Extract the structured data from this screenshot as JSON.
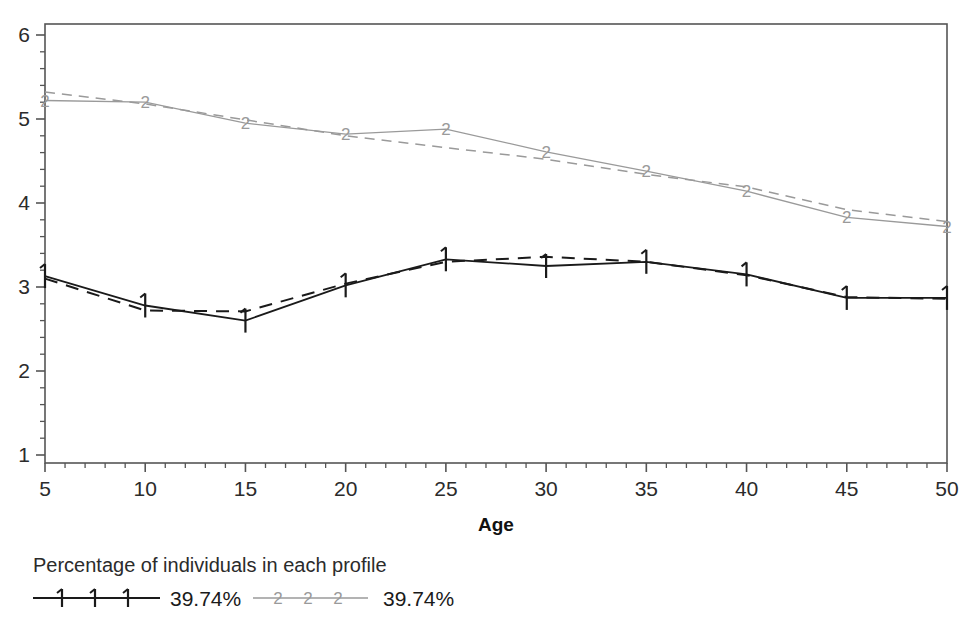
{
  "chart_data": {
    "type": "line",
    "title": "",
    "xlabel": "Age",
    "ylabel": "",
    "x": [
      5,
      10,
      15,
      20,
      25,
      30,
      35,
      40,
      45,
      50
    ],
    "xtick_labels": [
      "5",
      "10",
      "15",
      "20",
      "25",
      "30",
      "35",
      "40",
      "45",
      "50"
    ],
    "ytick_labels": [
      "1",
      "2",
      "3",
      "4",
      "5",
      "6"
    ],
    "yticks": [
      1,
      2,
      3,
      4,
      5,
      6
    ],
    "xlim": [
      5,
      50
    ],
    "ylim": [
      1,
      6
    ],
    "grid": false,
    "minor_ticks": true,
    "legend_position": "below-left",
    "series": [
      {
        "name": "1",
        "marker": "1",
        "color": "#1a1a1a",
        "legend_label": "39.74%",
        "observed_values": [
          3.13,
          2.78,
          2.6,
          3.02,
          3.33,
          3.25,
          3.3,
          3.15,
          2.87,
          2.87
        ],
        "fitted_values": [
          3.1,
          2.72,
          2.71,
          3.04,
          3.3,
          3.36,
          3.3,
          3.14,
          2.88,
          2.86
        ]
      },
      {
        "name": "2",
        "marker": "2",
        "color": "#9a9a9a",
        "legend_label": "39.74%",
        "observed_values": [
          5.22,
          5.2,
          4.95,
          4.82,
          4.88,
          4.61,
          4.38,
          4.14,
          3.83,
          3.72
        ],
        "fitted_values": [
          5.32,
          5.18,
          4.99,
          4.8,
          4.66,
          4.52,
          4.34,
          4.19,
          3.92,
          3.78
        ]
      }
    ]
  },
  "axis": {
    "x_title": "Age"
  },
  "legend": {
    "title": "Percentage of individuals in each profile",
    "entries": [
      {
        "symbol": "1 1 1",
        "label": "39.74%"
      },
      {
        "symbol": "2 2 2",
        "label": "39.74%"
      }
    ]
  }
}
